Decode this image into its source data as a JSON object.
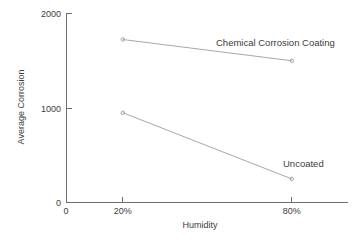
{
  "chart_data": {
    "type": "line",
    "title": "",
    "subtitle": "",
    "xlabel": "Humidity",
    "ylabel": "Average Corrosion",
    "categories": [
      "20%",
      "80%"
    ],
    "x": [
      20,
      80
    ],
    "xlim": [
      0,
      100
    ],
    "ylim": [
      0,
      2000
    ],
    "grid": false,
    "legend_position": "inline-right",
    "y_ticks": [
      {
        "value": 0,
        "label": "0"
      },
      {
        "value": 1000,
        "label": "1000"
      },
      {
        "value": 2000,
        "label": "2000"
      }
    ],
    "x_ticks": [
      {
        "value": 0,
        "label": "0"
      },
      {
        "value": 20,
        "label": "20%"
      },
      {
        "value": 80,
        "label": "80%"
      }
    ],
    "series": [
      {
        "name": "Chemical Corrosion Coating",
        "values": [
          1725,
          1500
        ],
        "color": "#a8a8a8",
        "label_x": 20,
        "label_y": 0
      },
      {
        "name": "Uncoated",
        "values": [
          950,
          250
        ],
        "color": "#a8a8a8",
        "label_x": 20,
        "label_y": 0
      }
    ],
    "annotations": [
      {
        "text": "Chemical Corrosion Coating",
        "series": "Chemical Corrosion Coating"
      },
      {
        "text": "Uncoated",
        "series": "Uncoated"
      }
    ]
  },
  "axes": {
    "y_title": "Average Corrosion",
    "x_title": "Humidity",
    "y_tick_0": "0",
    "y_tick_1000": "1000",
    "y_tick_2000": "2000",
    "x_tick_origin": "0",
    "x_tick_20": "20%",
    "x_tick_80": "80%"
  },
  "labels": {
    "series_coated": "Chemical Corrosion Coating",
    "series_uncoated": "Uncoated"
  },
  "colors": {
    "axis": "#6e6e6e",
    "line": "#a8a8a8",
    "text": "#3c3c3c",
    "background": "#ffffff"
  }
}
